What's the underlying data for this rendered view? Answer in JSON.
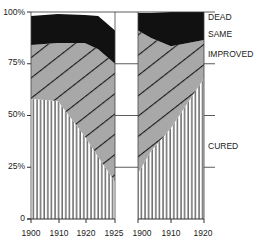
{
  "chart_data": {
    "type": "area",
    "stacked": true,
    "normalized_percent": true,
    "title": "",
    "xlabel": "",
    "ylabel": "",
    "ylim": [
      0,
      100
    ],
    "yticks": [
      "0",
      "25%",
      "50%",
      "75%",
      "100%"
    ],
    "legend_position": "right (inline labels)",
    "categories_order_bottom_to_top": [
      "CURED",
      "IMPROVED",
      "SAME",
      "DEAD"
    ],
    "panels": [
      {
        "name": "left",
        "x": [
          1900,
          1908,
          1916,
          1920,
          1925
        ],
        "xticks": [
          "1900",
          "1910",
          "1920",
          "1925"
        ],
        "series": [
          {
            "name": "CURED",
            "cumulative_top": [
              58,
              57,
              40,
              30,
              18
            ],
            "pattern": "vertical-lines"
          },
          {
            "name": "IMPROVED",
            "cumulative_top": [
              84,
              85,
              85,
              82,
              75
            ],
            "pattern": "grey-diagonal-hatch"
          },
          {
            "name": "SAME",
            "cumulative_top": [
              84,
              85,
              85,
              82,
              75
            ],
            "pattern": "none"
          },
          {
            "name": "DEAD",
            "cumulative_top": [
              98,
              99,
              98.5,
              98,
              91
            ],
            "pattern": "solid-black"
          }
        ]
      },
      {
        "name": "right",
        "x": [
          1900,
          1904,
          1910,
          1920
        ],
        "xticks": [
          "1900",
          "1910",
          "1920"
        ],
        "series": [
          {
            "name": "CURED",
            "cumulative_top": [
              22,
              33,
              44,
              68
            ],
            "pattern": "vertical-lines"
          },
          {
            "name": "IMPROVED",
            "cumulative_top": [
              91,
              87.5,
              83.5,
              86.5
            ],
            "pattern": "grey-diagonal-hatch"
          },
          {
            "name": "SAME",
            "cumulative_top": [
              91,
              87.5,
              83.5,
              86.5
            ],
            "pattern": "none"
          },
          {
            "name": "DEAD",
            "cumulative_top": [
              99.5,
              99.5,
              100,
              100
            ],
            "pattern": "solid-black"
          }
        ]
      }
    ]
  },
  "labels": {
    "dead": "DEAD",
    "same": "SAME",
    "improved": "IMPROVED",
    "cured": "CURED"
  },
  "axis": {
    "y_0": "0",
    "y_25": "25%",
    "y_50": "50%",
    "y_75": "75%",
    "y_100": "100%",
    "left_x": [
      "1900",
      "1910",
      "1920",
      "1925"
    ],
    "right_x": [
      "1900",
      "1910",
      "1920"
    ]
  },
  "colors": {
    "dead": "#111111",
    "improved": "#a8a8a8",
    "hatch": "#1a1a1a",
    "cured_lines": "#222222",
    "axis": "#333333"
  }
}
